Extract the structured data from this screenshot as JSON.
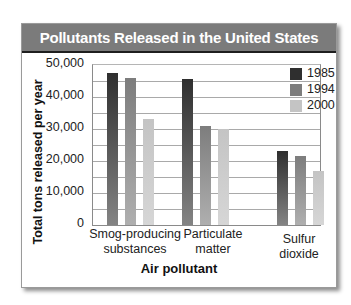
{
  "chart_data": {
    "type": "bar",
    "title": "Pollutants Released in the United States",
    "xlabel": "Air pollutant",
    "ylabel": "Total tons released per year",
    "ylim": [
      0,
      50000
    ],
    "yticks": [
      "50,000",
      "40,000",
      "30,000",
      "20,000",
      "10,000",
      "0"
    ],
    "grid": true,
    "grid_step": 5000,
    "legend_position": "upper right",
    "categories": [
      "Smog-producing substances",
      "Particulate matter",
      "Sulfur dioxide"
    ],
    "category_lines": [
      [
        "Smog-producing",
        "substances"
      ],
      [
        "Particulate",
        "matter"
      ],
      [
        "Sulfur",
        "dioxide"
      ]
    ],
    "series": [
      {
        "name": "1985",
        "color": "#2f2f2f",
        "values": [
          47500,
          45500,
          23000
        ]
      },
      {
        "name": "1994",
        "color": "#7d7d7d",
        "values": [
          46000,
          31000,
          21500
        ]
      },
      {
        "name": "2000",
        "color": "#c4c4c4",
        "values": [
          33000,
          30000,
          17000
        ]
      }
    ]
  },
  "colors": {
    "header_bg": "#7b7b7b",
    "header_text": "#ffffff",
    "gridline": "#a9a9a9"
  }
}
